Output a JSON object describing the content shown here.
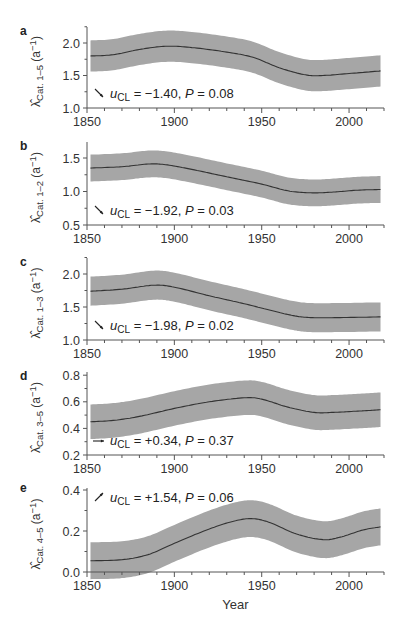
{
  "chart_data": [
    {
      "panel": "a",
      "type": "line",
      "ylabel_main": "λ̂",
      "ylabel_sub": "Cat. 1–5",
      "ylabel_unit": "(a",
      "ylabel_unit_exp": "−1",
      "ylim": [
        1.0,
        2.25
      ],
      "yticks": [
        1.0,
        1.5,
        2.0
      ],
      "ytick_labels": [
        "1.0",
        "1.5",
        "2.0"
      ],
      "annotation": {
        "arrow": "down",
        "u_label": "u",
        "u_sub": "CL",
        "text": " = −1.40, ",
        "p_label": "P",
        "p_text": " = 0.08"
      },
      "x": [
        1852,
        1865,
        1880,
        1895,
        1910,
        1930,
        1945,
        1960,
        1975,
        1985,
        2000,
        2018
      ],
      "mean": [
        1.8,
        1.82,
        1.9,
        1.95,
        1.93,
        1.86,
        1.78,
        1.62,
        1.51,
        1.5,
        1.53,
        1.57
      ],
      "band_halfwidth": 0.24
    },
    {
      "panel": "b",
      "type": "line",
      "ylabel_main": "λ̂",
      "ylabel_sub": "Cat. 1–2",
      "ylabel_unit": "(a",
      "ylabel_unit_exp": "−1",
      "ylim": [
        0.5,
        1.74
      ],
      "yticks": [
        0.5,
        1.0,
        1.5
      ],
      "ytick_labels": [
        "0.5",
        "1.0",
        "1.5"
      ],
      "annotation": {
        "arrow": "down",
        "u_label": "u",
        "u_sub": "CL",
        "text": " = −1.92, ",
        "p_label": "P",
        "p_text": " = 0.03"
      },
      "x": [
        1852,
        1870,
        1885,
        1895,
        1910,
        1930,
        1950,
        1965,
        1978,
        1990,
        2005,
        2018
      ],
      "mean": [
        1.35,
        1.37,
        1.41,
        1.4,
        1.33,
        1.22,
        1.11,
        1.01,
        0.98,
        0.99,
        1.02,
        1.03
      ],
      "band_halfwidth": 0.2
    },
    {
      "panel": "c",
      "type": "line",
      "ylabel_main": "λ̂",
      "ylabel_sub": "Cat. 1–3",
      "ylabel_unit": "(a",
      "ylabel_unit_exp": "−1",
      "ylim": [
        1.0,
        2.24
      ],
      "yticks": [
        1.0,
        1.5,
        2.0
      ],
      "ytick_labels": [
        "1.0",
        "1.5",
        "2.0"
      ],
      "annotation": {
        "arrow": "down",
        "u_label": "u",
        "u_sub": "CL",
        "text": " = −1.98, ",
        "p_label": "P",
        "p_text": " = 0.02"
      },
      "x": [
        1852,
        1870,
        1888,
        1900,
        1920,
        1940,
        1955,
        1968,
        1978,
        1995,
        2018
      ],
      "mean": [
        1.74,
        1.77,
        1.83,
        1.8,
        1.67,
        1.55,
        1.45,
        1.37,
        1.34,
        1.34,
        1.35
      ],
      "band_halfwidth": 0.22
    },
    {
      "panel": "d",
      "type": "line",
      "ylabel_main": "λ̂",
      "ylabel_sub": "Cat. 3–5",
      "ylabel_unit": "(a",
      "ylabel_unit_exp": "−1",
      "ylim": [
        0.2,
        0.82
      ],
      "yticks": [
        0.2,
        0.4,
        0.6,
        0.8
      ],
      "ytick_labels": [
        "0.2",
        "0.4",
        "0.6",
        "0.8"
      ],
      "annotation": {
        "arrow": "right",
        "u_label": "u",
        "u_sub": "CL",
        "text": " = +0.34, ",
        "p_label": "P",
        "p_text": " = 0.37"
      },
      "x": [
        1852,
        1865,
        1880,
        1900,
        1920,
        1940,
        1950,
        1965,
        1980,
        1990,
        2005,
        2018
      ],
      "mean": [
        0.45,
        0.46,
        0.49,
        0.55,
        0.6,
        0.63,
        0.62,
        0.56,
        0.52,
        0.52,
        0.53,
        0.54
      ],
      "band_halfwidth": 0.13
    },
    {
      "panel": "e",
      "type": "line",
      "ylabel_main": "λ̂",
      "ylabel_sub": "Cat. 4–5",
      "ylabel_unit": "(a",
      "ylabel_unit_exp": "−1",
      "ylim": [
        0.0,
        0.4
      ],
      "yticks": [
        0.0,
        0.2,
        0.4
      ],
      "ytick_labels": [
        "0.0",
        "0.2",
        "0.4"
      ],
      "annotation": {
        "arrow": "up",
        "u_label": "u",
        "u_sub": "CL",
        "text": " = +1.54, ",
        "p_label": "P",
        "p_text": " = 0.06"
      },
      "x": [
        1852,
        1870,
        1885,
        1900,
        1920,
        1935,
        1945,
        1955,
        1970,
        1985,
        1995,
        2008,
        2018
      ],
      "mean": [
        0.055,
        0.06,
        0.085,
        0.14,
        0.21,
        0.25,
        0.26,
        0.24,
        0.185,
        0.158,
        0.17,
        0.205,
        0.22
      ],
      "band_halfwidth": 0.09
    }
  ],
  "xaxis": {
    "xlim": [
      1850,
      2020
    ],
    "xticks_major": [
      1850,
      1900,
      1950,
      2000
    ],
    "xtick_labels": [
      "1850",
      "1900",
      "1950",
      "2000"
    ],
    "xticks_minor_step": 10,
    "xlabel": "Year"
  },
  "style": {
    "band_color": "#a6a6a6",
    "line_color": "#333333",
    "axis_color": "#555555"
  }
}
